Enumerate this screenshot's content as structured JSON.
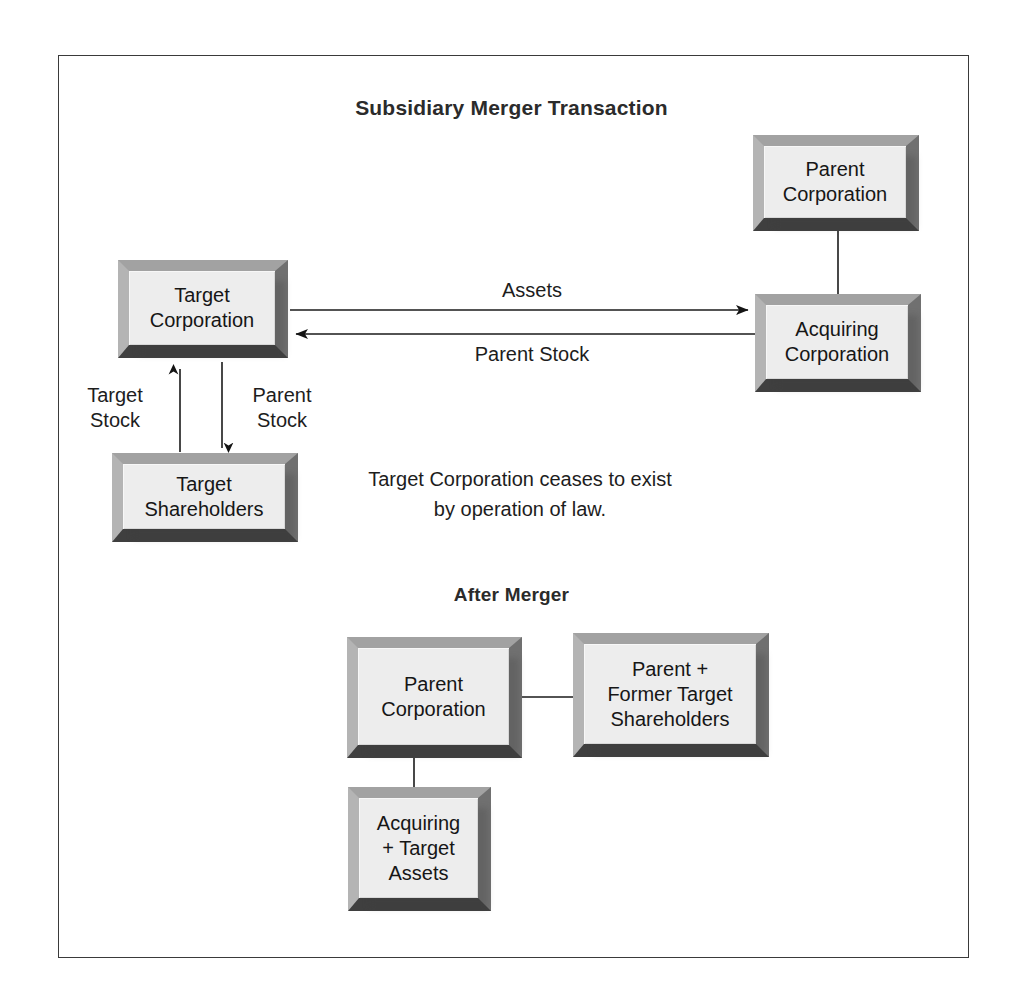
{
  "diagram": {
    "title": "Subsidiary Merger Transaction",
    "after_merger_title": "After Merger",
    "note": "Target Corporation ceases to exist by operation of law.",
    "boxes": {
      "parent_corporation": "Parent\nCorporation",
      "target_corporation": "Target\nCorporation",
      "acquiring_corporation": "Acquiring\nCorporation",
      "target_shareholders": "Target\nShareholders",
      "after_parent_corporation": "Parent\nCorporation",
      "after_shareholders": "Parent +\nFormer Target\nShareholders",
      "after_assets": "Acquiring\n+ Target\nAssets"
    },
    "flows": {
      "assets": "Assets",
      "parent_stock": "Parent Stock",
      "target_stock_vertical": "Target\nStock",
      "parent_stock_vertical": "Parent\nStock"
    },
    "colors": {
      "box_face": "#ededed",
      "bevel_light": "#b4b4b4",
      "bevel_dark": "#3f3f3f",
      "line": "#1a1a1a",
      "frame": "#3a3a3a",
      "text": "#161616"
    }
  }
}
